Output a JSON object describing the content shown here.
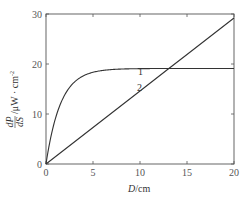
{
  "chart_data": {
    "type": "line",
    "title": "",
    "xlabel": "D/cm",
    "xlabel_italic": "D",
    "xlabel_unit": "/cm",
    "ylabel": "dP/dS /μW·cm⁻²",
    "ylabel_num": "dP",
    "ylabel_den": "dS",
    "ylabel_unit": "/μW · cm",
    "ylabel_exp": "-2",
    "xlim": [
      0,
      20
    ],
    "ylim": [
      0,
      30
    ],
    "xticks": [
      0,
      5,
      10,
      15,
      20
    ],
    "yticks": [
      0,
      10,
      20,
      30
    ],
    "grid": false,
    "legend": "inline labels",
    "series": [
      {
        "name": "1",
        "x": [
          0,
          0.5,
          1,
          1.5,
          2,
          2.5,
          3,
          4,
          5,
          6,
          8,
          10,
          13,
          16,
          20
        ],
        "values": [
          0,
          6.5,
          11,
          13.8,
          15.6,
          16.7,
          17.5,
          18.3,
          18.7,
          18.9,
          19.0,
          19.05,
          19.1,
          19.1,
          19.1
        ]
      },
      {
        "name": "2",
        "x": [
          0,
          5,
          10,
          13,
          15,
          20
        ],
        "values": [
          0,
          7.3,
          14.6,
          19.0,
          21.9,
          29.2
        ]
      }
    ]
  },
  "labels": {
    "series1": "1",
    "series2": "2",
    "x_ticks": [
      "0",
      "5",
      "10",
      "15",
      "20"
    ],
    "y_ticks": [
      "0",
      "10",
      "20",
      "30"
    ]
  }
}
